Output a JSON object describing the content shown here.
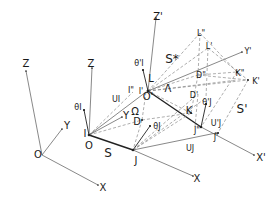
{
  "colors": {
    "line": "#444444",
    "thick": "#222222",
    "dash": "#777777",
    "text": "#1a1a1a",
    "background": "#ffffff"
  },
  "labels": {
    "world_origin": {
      "text": "O",
      "x": 38,
      "y": 155
    },
    "world_z": {
      "text": "Z",
      "x": 26,
      "y": 64
    },
    "world_y": {
      "text": "Y",
      "x": 67,
      "y": 126
    },
    "world_x": {
      "text": "X",
      "x": 103,
      "y": 188
    },
    "frame_i_z": {
      "text": "Z",
      "x": 91,
      "y": 64
    },
    "frame_i_y": {
      "text": "Y",
      "x": 125,
      "y": 116
    },
    "point_i": {
      "text": "I",
      "x": 86,
      "y": 135
    },
    "origin_o": {
      "text": "O",
      "x": 89,
      "y": 146
    },
    "theta_i": {
      "text": "θI",
      "x": 79,
      "y": 107
    },
    "u_i": {
      "text": "UI",
      "x": 116,
      "y": 100
    },
    "i_prime": {
      "text": "I'",
      "x": 143,
      "y": 92
    },
    "i_double_prime": {
      "text": "I\"",
      "x": 131,
      "y": 90
    },
    "o_prime": {
      "text": "O'",
      "x": 146,
      "y": 98
    },
    "theta_i_prime": {
      "text": "θ'I",
      "x": 140,
      "y": 64
    },
    "omega": {
      "text": "Ω",
      "x": 136,
      "y": 113
    },
    "point_l": {
      "text": "L",
      "x": 150,
      "y": 79
    },
    "lambda": {
      "text": "Λ",
      "x": 167,
      "y": 89
    },
    "s_star": {
      "text": "S*",
      "x": 171,
      "y": 60
    },
    "z_prime": {
      "text": "Z'",
      "x": 157,
      "y": 17
    },
    "l_double_prime": {
      "text": "L\"",
      "x": 201,
      "y": 34
    },
    "l_prime": {
      "text": "L'",
      "x": 209,
      "y": 47
    },
    "y_prime": {
      "text": "Y'",
      "x": 247,
      "y": 52
    },
    "d_double_prime": {
      "text": "D\"",
      "x": 201,
      "y": 76
    },
    "d_prime": {
      "text": "D'",
      "x": 194,
      "y": 96
    },
    "k_double_prime": {
      "text": "K\"",
      "x": 240,
      "y": 74
    },
    "k_prime": {
      "text": "K'",
      "x": 255,
      "y": 82
    },
    "s_prime": {
      "text": "S'",
      "x": 241,
      "y": 110
    },
    "theta_j_prime": {
      "text": "θ'J",
      "x": 207,
      "y": 103
    },
    "point_d": {
      "text": "D",
      "x": 137,
      "y": 122
    },
    "point_k": {
      "text": "K",
      "x": 189,
      "y": 111
    },
    "u_j_prime": {
      "text": "U'J",
      "x": 215,
      "y": 124
    },
    "j_double_prime": {
      "text": "J\"",
      "x": 198,
      "y": 130
    },
    "j_prime": {
      "text": "J'",
      "x": 216,
      "y": 136
    },
    "theta_j": {
      "text": "θJ",
      "x": 157,
      "y": 126
    },
    "point_j": {
      "text": "J",
      "x": 137,
      "y": 161
    },
    "u_j": {
      "text": "UJ",
      "x": 190,
      "y": 149
    },
    "frame_j_x": {
      "text": "X",
      "x": 196,
      "y": 179
    },
    "x_prime": {
      "text": "X'",
      "x": 260,
      "y": 159
    },
    "s": {
      "text": "S",
      "x": 107,
      "y": 153
    }
  }
}
